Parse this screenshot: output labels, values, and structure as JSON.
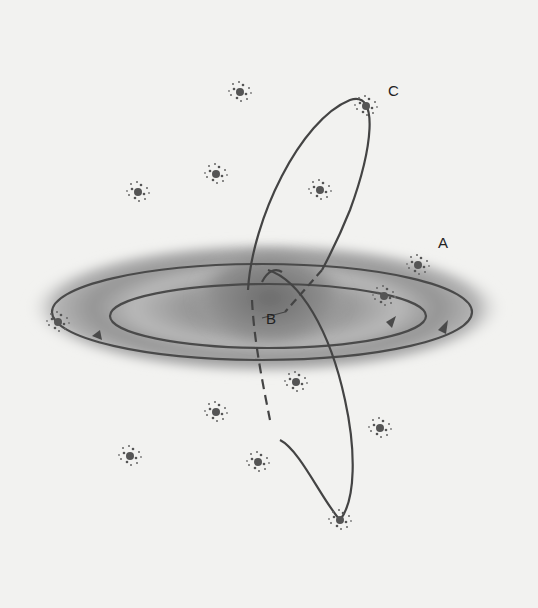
{
  "figure": {
    "labels": {
      "a": "A",
      "b": "B",
      "c": "C"
    },
    "colors": {
      "background": "#f2f2f0",
      "disk": "#8a8a8a",
      "orbit": "#4a4a4a",
      "text": "#222222"
    }
  }
}
